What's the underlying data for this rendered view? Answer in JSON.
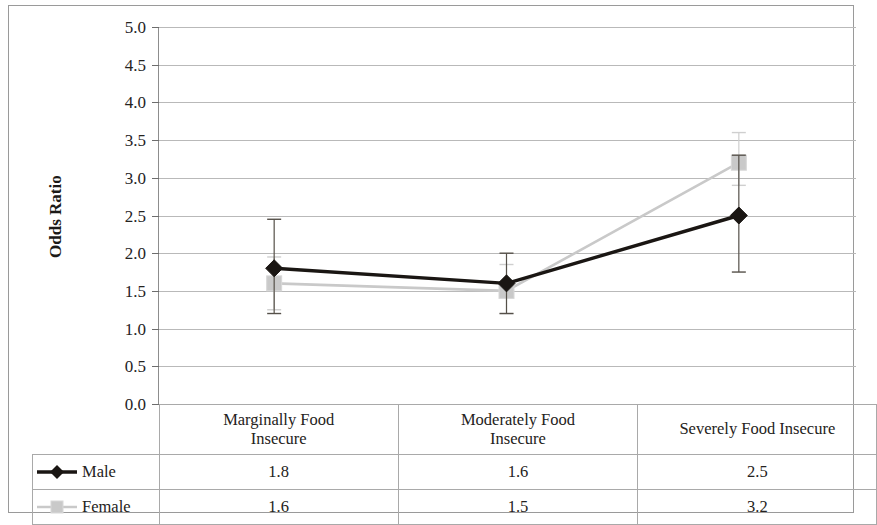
{
  "chart_data": {
    "type": "line",
    "title": "",
    "xlabel": "",
    "ylabel": "Odds Ratio",
    "ylim": [
      0.0,
      5.0
    ],
    "ytick_step": 0.5,
    "grid": true,
    "legend_position": "table-left",
    "categories": [
      "Marginally Food Insecure",
      "Moderately Food Insecure",
      "Severely Food Insecure"
    ],
    "ytick_labels": [
      "5.0",
      "4.5",
      "4.0",
      "3.5",
      "3.0",
      "2.5",
      "2.0",
      "1.5",
      "1.0",
      "0.5",
      "0.0"
    ],
    "ytick_values": [
      5.0,
      4.5,
      4.0,
      3.5,
      3.0,
      2.5,
      2.0,
      1.5,
      1.0,
      0.5,
      0.0
    ],
    "series": [
      {
        "name": "Male",
        "color": "#1a1613",
        "marker": "diamond",
        "values": [
          1.8,
          1.6,
          2.5
        ],
        "labels": [
          "1.8",
          "1.6",
          "2.5"
        ],
        "error_low": [
          1.2,
          1.2,
          1.75
        ],
        "error_high": [
          2.45,
          2.0,
          3.3
        ]
      },
      {
        "name": "Female",
        "color": "#c9c9c9",
        "marker": "square",
        "values": [
          1.6,
          1.5,
          3.2
        ],
        "labels": [
          "1.6",
          "1.5",
          "3.2"
        ],
        "error_low": [
          1.25,
          1.2,
          2.9
        ],
        "error_high": [
          1.95,
          1.85,
          3.6
        ]
      }
    ]
  },
  "table": {
    "legend_header": "",
    "column_headers": [
      "Marginally Food\nInsecure",
      "Moderately Food\nInsecure",
      "Severely Food Insecure"
    ],
    "header_line1": [
      "Marginally Food",
      "Moderately Food",
      "Severely Food Insecure"
    ],
    "header_line2": [
      "Insecure",
      "Insecure",
      ""
    ],
    "rows": [
      {
        "label": "Male",
        "values": [
          "1.8",
          "1.6",
          "2.5"
        ]
      },
      {
        "label": "Female",
        "values": [
          "1.6",
          "1.5",
          "3.2"
        ]
      }
    ]
  },
  "colors": {
    "male": "#1a1613",
    "female": "#c9c9c9",
    "grid": "#b9b9b9",
    "border": "#a9a9a9",
    "text": "#242220"
  }
}
